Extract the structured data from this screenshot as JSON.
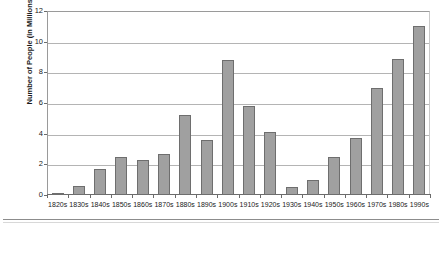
{
  "chart_data": {
    "type": "bar",
    "title": "",
    "xlabel": "",
    "ylabel": "Number of People (in Millions)",
    "ylim": [
      0,
      12
    ],
    "y_ticks": [
      0,
      2,
      4,
      6,
      8,
      10,
      12
    ],
    "y_tick_labels": [
      "0",
      "2",
      "4",
      "6",
      "8",
      "10",
      "12"
    ],
    "grid": "horizontal",
    "legend": "none",
    "bar_color": "#a0a0a0",
    "bar_edge_color": "#6e6e6e",
    "categories": [
      "1820s",
      "1830s",
      "1840s",
      "1850s",
      "1860s",
      "1870s",
      "1880s",
      "1890s",
      "1900s",
      "1910s",
      "1920s",
      "1930s",
      "1940s",
      "1950s",
      "1960s",
      "1970s",
      "1980s",
      "1990s"
    ],
    "values": [
      0.15,
      0.6,
      1.7,
      2.5,
      2.3,
      2.7,
      5.2,
      3.6,
      8.8,
      5.8,
      4.1,
      0.5,
      1.0,
      2.5,
      3.7,
      7.0,
      8.9,
      11.0
    ]
  }
}
